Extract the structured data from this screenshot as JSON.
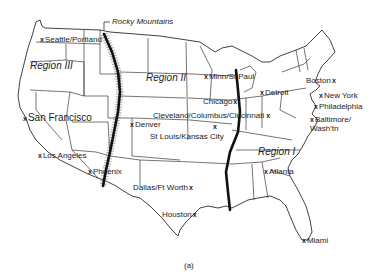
{
  "map": {
    "title_annotation": "Rocky Mountains",
    "caption": "(a)",
    "regions": [
      {
        "id": "region-1",
        "label": "Region I"
      },
      {
        "id": "region-2",
        "label": "Region II"
      },
      {
        "id": "region-3",
        "label": "Region III"
      }
    ],
    "cities": [
      {
        "id": "seattle-portland",
        "label": "Seattle/Portland",
        "marker": "x"
      },
      {
        "id": "san-francisco",
        "label": "San Francisco",
        "marker": "x"
      },
      {
        "id": "los-angeles",
        "label": "Los Angeles",
        "marker": "x"
      },
      {
        "id": "phoenix",
        "label": "Phoenix",
        "marker": "x"
      },
      {
        "id": "denver",
        "label": "Denver",
        "marker": "x"
      },
      {
        "id": "dallas-ft-worth",
        "label": "Dallas/Ft Worth",
        "marker": "x"
      },
      {
        "id": "houston",
        "label": "Houston",
        "marker": "x"
      },
      {
        "id": "minn-st-paul",
        "label": "Minn/St Paul",
        "marker": "x"
      },
      {
        "id": "chicago",
        "label": "Chicago",
        "marker": "x"
      },
      {
        "id": "cleveland-columbus-cincinnati",
        "label": "Cleveland/Columbus/Cincinnati",
        "marker": "x"
      },
      {
        "id": "st-louis-kansas-city",
        "label": "St Louis/Kansas City",
        "marker": "x"
      },
      {
        "id": "detroit",
        "label": "Detroit",
        "marker": "x"
      },
      {
        "id": "boston",
        "label": "Boston",
        "marker": "x"
      },
      {
        "id": "new-york",
        "label": "New York",
        "marker": "x"
      },
      {
        "id": "philadelphia",
        "label": "Philadelphia",
        "marker": "x"
      },
      {
        "id": "baltimore-washington",
        "label": "Baltimore/ Wash'tn",
        "marker": "x"
      },
      {
        "id": "atlanta",
        "label": "Atlanta",
        "marker": "x"
      },
      {
        "id": "miami",
        "label": "Miami",
        "marker": "x"
      }
    ],
    "boundaries": [
      {
        "id": "rocky-mountain-divide",
        "description": "Thick line along Rocky Mountains separating Region III from Region II"
      },
      {
        "id": "mississippi-divide",
        "description": "Thick line along Mississippi River separating Region II from Region I"
      }
    ],
    "colors": {
      "ink": "#1b1b1b",
      "background": "#ffffff",
      "mountain_shading": "#9a9a9a"
    }
  }
}
